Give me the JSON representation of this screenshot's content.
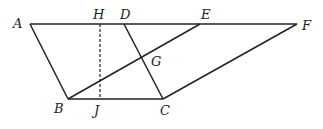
{
  "diagram": {
    "type": "geometry",
    "points": {
      "A": {
        "label": "A",
        "x": 30,
        "y": 24
      },
      "H": {
        "label": "H",
        "x": 100,
        "y": 24
      },
      "D": {
        "label": "D",
        "x": 124,
        "y": 24
      },
      "E": {
        "label": "E",
        "x": 200,
        "y": 24
      },
      "F": {
        "label": "F",
        "x": 297,
        "y": 24
      },
      "B": {
        "label": "B",
        "x": 68,
        "y": 99
      },
      "J": {
        "label": "J",
        "x": 100,
        "y": 99
      },
      "C": {
        "label": "C",
        "x": 163,
        "y": 99
      },
      "G": {
        "label": "G",
        "x": 142,
        "y": 57
      }
    },
    "segments": [
      {
        "from": "A",
        "to": "F",
        "style": "solid"
      },
      {
        "from": "A",
        "to": "B",
        "style": "solid"
      },
      {
        "from": "B",
        "to": "C",
        "style": "solid"
      },
      {
        "from": "D",
        "to": "C",
        "style": "solid"
      },
      {
        "from": "B",
        "to": "E",
        "style": "solid"
      },
      {
        "from": "C",
        "to": "F",
        "style": "solid"
      },
      {
        "from": "H",
        "to": "J",
        "style": "dashed"
      }
    ],
    "labels": {
      "A": "A",
      "H": "H",
      "D": "D",
      "E": "E",
      "F": "F",
      "B": "B",
      "J": "J",
      "C": "C",
      "G": "G"
    }
  }
}
